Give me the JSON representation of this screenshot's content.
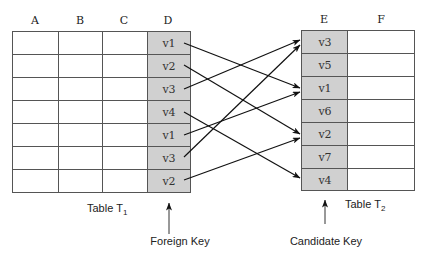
{
  "table1": {
    "label": "Table T",
    "label_subscript": "1",
    "columns": [
      "A",
      "B",
      "C",
      "D"
    ],
    "key_column": "D",
    "key_values": [
      "v1",
      "v2",
      "v3",
      "v4",
      "v1",
      "v3",
      "v2"
    ]
  },
  "table2": {
    "label": "Table T",
    "label_subscript": "2",
    "columns": [
      "E",
      "F"
    ],
    "key_column": "E",
    "key_values": [
      "v3",
      "v5",
      "v1",
      "v6",
      "v2",
      "v7",
      "v4"
    ]
  },
  "annotations": {
    "foreign_key": "Foreign Key",
    "candidate_key": "Candidate Key"
  },
  "mappings": [
    {
      "from_row": 0,
      "value": "v1",
      "to_row": 2
    },
    {
      "from_row": 1,
      "value": "v2",
      "to_row": 4
    },
    {
      "from_row": 2,
      "value": "v3",
      "to_row": 0
    },
    {
      "from_row": 3,
      "value": "v4",
      "to_row": 6
    },
    {
      "from_row": 4,
      "value": "v1",
      "to_row": 2
    },
    {
      "from_row": 5,
      "value": "v3",
      "to_row": 0
    },
    {
      "from_row": 6,
      "value": "v2",
      "to_row": 4
    }
  ],
  "colors": {
    "key_fill": "#d0d0d0",
    "grid": "#555555",
    "arrow": "#111111"
  }
}
